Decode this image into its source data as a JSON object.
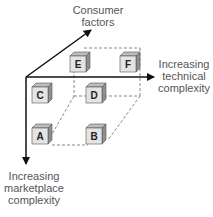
{
  "diagram": {
    "axes": {
      "consumer": {
        "line1": "Consumer",
        "line2": "factors"
      },
      "technical": {
        "line1": "Increasing",
        "line2": "technical",
        "line3": "complexity"
      },
      "marketplace": {
        "line1": "Increasing",
        "line2": "marketplace",
        "line3": "complexity"
      }
    },
    "cubes": [
      {
        "label": "E"
      },
      {
        "label": "F"
      },
      {
        "label": "C"
      },
      {
        "label": "D"
      },
      {
        "label": "A"
      },
      {
        "label": "B"
      }
    ],
    "colors": {
      "axis": "#111111",
      "dashed": "#888888",
      "cube_front": "#e4e4e4",
      "cube_top": "#bdbdbd",
      "cube_side": "#8f8f8f",
      "text": "#555555"
    }
  }
}
